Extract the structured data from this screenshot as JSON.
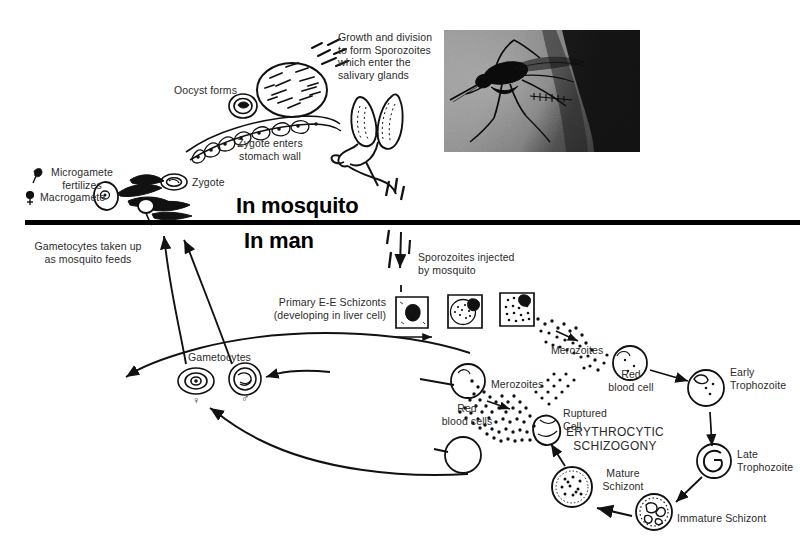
{
  "figure": {
    "kind": "malaria-life-cycle-diagram",
    "background_color": "#ffffff",
    "ink_color": "#1a1a1a"
  },
  "sections": {
    "mosquito_heading": "In mosquito",
    "man_heading": "In man",
    "divider_color": "#000000"
  },
  "labels": {
    "oocyst_forms": "Oocyst forms",
    "zygote_enters_stomach_wall": "Zygote enters\nstomach wall",
    "zygote": "Zygote",
    "microgamete_fertilizes": "Microgamete\nfertilizes",
    "macrogamete": "Macrogamete",
    "growth_and_division": "Growth and division\nto form Sporozoites\nwhich enter the\nsalivary glands",
    "gametocytes_taken_up": "Gametocytes taken up\nas mosquito feeds",
    "sporozoites_injected": "Sporozoites injected\nby mosquito",
    "primary_ee_schizonts": "Primary E-E Schizonts\n(developing in liver cell)",
    "gametocytes": "Gametocytes",
    "merozoites_upper": "Merozoites",
    "merozoites_lower": "Merozoites",
    "red_blood_cell": "Red\nblood cell",
    "red_blood_cells": "Red\nblood cells",
    "ruptured_cell": "Ruptured\nCell",
    "erythrocytic_schizogony": "ERYTHROCYTIC\nSCHIZOGONY",
    "early_trophozoite": "Early\nTrophozoite",
    "late_trophozoite": "Late\nTrophozoite",
    "immature_schizont": "Immature Schizont",
    "mature_schizont": "Mature\nSchizont",
    "female_symbol": "♀",
    "male_symbol": "♂",
    "microgamete_symbol": "♂",
    "macrogamete_symbol": "♀"
  },
  "photo": {
    "name": "mosquito-photograph",
    "subject": "anopheles mosquito feeding on skin",
    "tone": "grayscale halftone"
  },
  "icons": {
    "oocyst": "oocyst-icon",
    "zygote": "zygote-icon",
    "ookinete": "ookinete-icon",
    "stomach_wall": "stomach-wall-icon",
    "salivary_gland": "salivary-gland-icon",
    "liver_cell_schizont": "liver-cell-schizont-icon",
    "merozoite_swarm": "merozoite-swarm-icon",
    "red_blood_cell": "red-blood-cell-icon",
    "ruptured_cell": "ruptured-cell-icon",
    "early_trophozoite": "early-trophozoite-icon",
    "late_trophozoite": "late-trophozoite-icon",
    "immature_schizont": "immature-schizont-icon",
    "mature_schizont": "mature-schizont-icon",
    "gametocyte_female": "gametocyte-female-icon",
    "gametocyte_male": "gametocyte-male-icon",
    "sporozoite_arrow": "sporozoite-arrow-icon"
  }
}
